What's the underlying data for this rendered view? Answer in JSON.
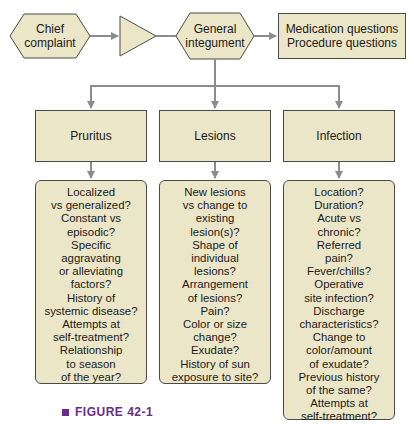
{
  "colors": {
    "box_fill": "#ece6c8",
    "border": "#4a4a4a",
    "arrow": "#8c8c8c",
    "caption": "#6a2b8a"
  },
  "top_row": {
    "chief_complaint": "Chief complaint",
    "chief_complaint_lines": [
      "Chief",
      "complaint"
    ],
    "general_integument_lines": [
      "General",
      "integument"
    ],
    "questions_lines": [
      "Medication questions",
      "Procedure questions"
    ]
  },
  "categories": [
    {
      "label": "Pruritus",
      "questions": [
        "Localized",
        "vs generalized?",
        "Constant vs",
        "episodic?",
        "Specific",
        "aggravating",
        "or alleviating",
        "factors?",
        "History of",
        "systemic disease?",
        "Attempts at",
        "self-treatment?",
        "Relationship",
        "to season",
        "of the year?"
      ]
    },
    {
      "label": "Lesions",
      "questions": [
        "New lesions",
        "vs change to",
        "existing",
        "lesion(s)?",
        "Shape of",
        "individual",
        "lesions?",
        "Arrangement",
        "of lesions?",
        "Pain?",
        "Color or size",
        "change?",
        "Exudate?",
        "History of sun",
        "exposure to site?"
      ]
    },
    {
      "label": "Infection",
      "questions": [
        "Location?",
        "Duration?",
        "Acute vs",
        "chronic?",
        "Referred",
        "pain?",
        "Fever/chills?",
        "Operative",
        "site infection?",
        "Discharge",
        "characteristics?",
        "Change to",
        "color/amount",
        "of exudate?",
        "Previous history",
        "of the same?",
        "Attempts at",
        "self-treatment?"
      ]
    }
  ],
  "caption": "FIGURE 42-1"
}
